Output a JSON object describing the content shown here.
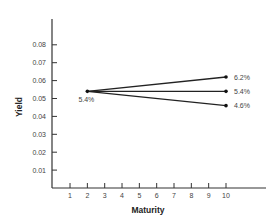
{
  "chart_data": {
    "type": "line",
    "title": "",
    "xlabel": "Maturity",
    "ylabel": "Yield",
    "x_ticks": [
      "1",
      "2",
      "3",
      "4",
      "5",
      "6",
      "7",
      "8",
      "9",
      "10"
    ],
    "y_ticks": [
      "0.01",
      "0.02",
      "0.03",
      "0.04",
      "0.05",
      "0.06",
      "0.07",
      "0.08"
    ],
    "xlim": [
      0,
      12
    ],
    "ylim": [
      0,
      0.095
    ],
    "grid": false,
    "legend": null,
    "series": [
      {
        "name": "Upward",
        "x": [
          2,
          10
        ],
        "y": [
          0.054,
          0.062
        ],
        "end_label": "6.2%"
      },
      {
        "name": "Flat",
        "x": [
          2,
          10
        ],
        "y": [
          0.054,
          0.054
        ],
        "end_label": "5.4%"
      },
      {
        "name": "Downward",
        "x": [
          2,
          10
        ],
        "y": [
          0.054,
          0.046
        ],
        "end_label": "4.6%"
      }
    ],
    "annotations": [
      {
        "x": 2,
        "y": 0.054,
        "text": "5.4%",
        "position": "below"
      }
    ]
  }
}
